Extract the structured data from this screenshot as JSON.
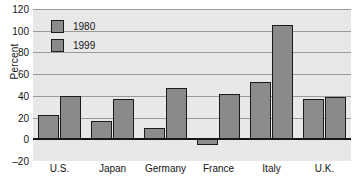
{
  "chart_data": {
    "type": "bar",
    "title": "",
    "xlabel": "",
    "ylabel": "Percent",
    "categories": [
      "U.S.",
      "Japan",
      "Germany",
      "France",
      "Italy",
      "U.K."
    ],
    "series": [
      {
        "name": "1980",
        "values": [
          22,
          17,
          10,
          -5,
          53,
          37
        ],
        "color": "#8c8c8c"
      },
      {
        "name": "1999",
        "values": [
          40,
          37,
          47,
          42,
          105,
          39
        ],
        "color": "#8a8a8a"
      }
    ],
    "ylim": [
      -20,
      120
    ],
    "yticks": [
      120,
      100,
      80,
      60,
      40,
      20,
      0,
      -20
    ],
    "ytick_labels": [
      "120",
      "100",
      "80",
      "60",
      "40",
      "20",
      "0",
      "–20"
    ],
    "grid": true,
    "legend_position": "upper-left-inside",
    "plot_background": "#e8e8e8",
    "grid_color": "#9a9a9a",
    "zero_line_color": "#141414",
    "bar_edge_color": "#1b1b1b"
  },
  "legend": {
    "entries": [
      {
        "label": "1980"
      },
      {
        "label": "1999"
      }
    ]
  }
}
